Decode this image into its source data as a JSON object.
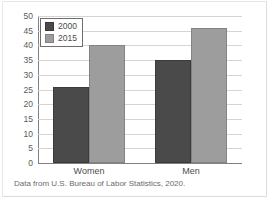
{
  "chart_data": {
    "type": "bar",
    "title": "",
    "xlabel": "",
    "ylabel": "",
    "categories": [
      "Women",
      "Men"
    ],
    "series": [
      {
        "name": "2000",
        "values": [
          26,
          35
        ],
        "color": "#4a4a4a"
      },
      {
        "name": "2015",
        "values": [
          40,
          46
        ],
        "color": "#9d9d9d"
      }
    ],
    "ylim": [
      0,
      50
    ],
    "yticks": [
      0,
      5,
      10,
      15,
      20,
      25,
      30,
      35,
      40,
      45,
      50
    ],
    "ytick_labels": [
      "0",
      "5",
      "10",
      "15",
      "20",
      "25",
      "30",
      "35",
      "40",
      "45",
      "50"
    ],
    "grid": true,
    "legend_position": "top-left",
    "bars": [
      {
        "category": "Women",
        "series": "2000",
        "value": 26
      },
      {
        "category": "Women",
        "series": "2015",
        "value": 35
      },
      {
        "category": "Men",
        "series": "2000",
        "value": 40
      },
      {
        "category": "Men",
        "series": "2015",
        "value": 46
      }
    ]
  },
  "legend": {
    "items": [
      {
        "label": "2000"
      },
      {
        "label": "2015"
      }
    ]
  },
  "caption": {
    "text": "Data from U.S. Bureau of Labor Statistics, 2020."
  }
}
